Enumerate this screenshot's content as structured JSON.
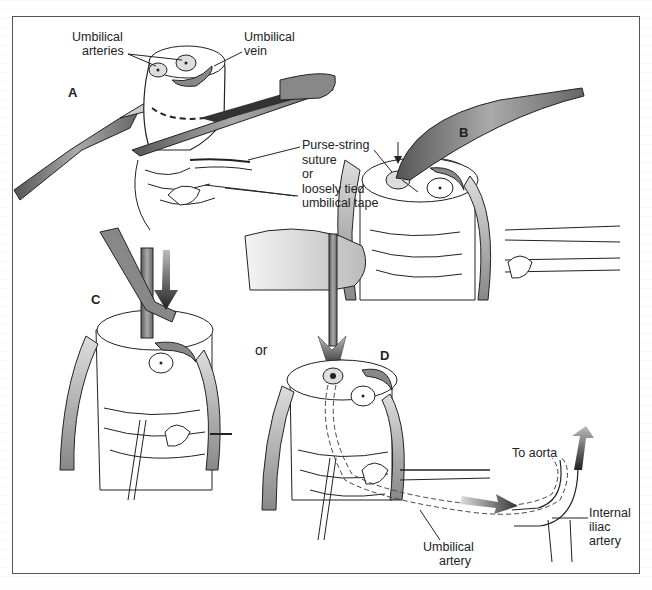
{
  "figure": {
    "panels": [
      {
        "id": "A",
        "label": "A"
      },
      {
        "id": "B",
        "label": "B"
      },
      {
        "id": "C",
        "label": "C"
      },
      {
        "id": "D",
        "label": "D"
      }
    ],
    "connector_text": "or",
    "labels": {
      "umbilical_arteries": [
        "Umbilical",
        "arteries"
      ],
      "umbilical_vein": [
        "Umbilical",
        "vein"
      ],
      "purse_string": [
        "Purse-string",
        "suture",
        "or",
        "loosely tied",
        "umbilical tape"
      ],
      "to_aorta": "To aorta",
      "internal_iliac": [
        "Internal",
        "iliac",
        "artery"
      ],
      "umbilical_artery": [
        "Umbilical",
        "artery"
      ]
    },
    "colors": {
      "frame": "#555555",
      "ink": "#222222",
      "instrument_gray": "#7a7a7a",
      "arrow_dark": "#333333"
    }
  }
}
